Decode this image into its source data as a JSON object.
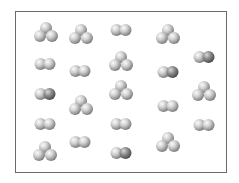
{
  "diagram": {
    "box": {
      "left": 15,
      "top": 11,
      "width": 212,
      "height": 162,
      "border_color": "#6a6a6a"
    },
    "atom": {
      "radius": 6,
      "light_color": "#c9c9c9",
      "dark_color": "#8a8a8a",
      "highlight": "#f4f4f4",
      "shadow": "#7a7a7a"
    },
    "molecules": [
      {
        "type": "triatomic",
        "x": 46,
        "y": 34
      },
      {
        "type": "triatomic",
        "x": 81,
        "y": 36
      },
      {
        "type": "diatomic",
        "x": 121,
        "y": 30,
        "dark_right": false
      },
      {
        "type": "triatomic",
        "x": 168,
        "y": 36
      },
      {
        "type": "diatomic",
        "x": 45,
        "y": 64,
        "dark_right": false
      },
      {
        "type": "diatomic",
        "x": 80,
        "y": 71,
        "dark_right": false
      },
      {
        "type": "triatomic",
        "x": 121,
        "y": 63
      },
      {
        "type": "diatomic",
        "x": 168,
        "y": 72,
        "dark_right": true
      },
      {
        "type": "diatomic",
        "x": 204,
        "y": 57,
        "dark_right": true
      },
      {
        "type": "diatomic",
        "x": 45,
        "y": 94,
        "dark_right": true
      },
      {
        "type": "triatomic",
        "x": 81,
        "y": 107
      },
      {
        "type": "triatomic",
        "x": 121,
        "y": 92
      },
      {
        "type": "diatomic",
        "x": 168,
        "y": 106,
        "dark_right": false
      },
      {
        "type": "triatomic",
        "x": 204,
        "y": 93
      },
      {
        "type": "diatomic",
        "x": 45,
        "y": 124,
        "dark_right": false
      },
      {
        "type": "diatomic",
        "x": 80,
        "y": 142,
        "dark_right": false
      },
      {
        "type": "diatomic",
        "x": 121,
        "y": 124,
        "dark_right": false
      },
      {
        "type": "diatomic",
        "x": 204,
        "y": 125,
        "dark_right": false
      },
      {
        "type": "triatomic",
        "x": 45,
        "y": 153
      },
      {
        "type": "diatomic",
        "x": 121,
        "y": 153,
        "dark_right": true
      },
      {
        "type": "triatomic",
        "x": 168,
        "y": 144
      }
    ],
    "counts": {
      "diatomic": 12,
      "triatomic": 9,
      "total": 21
    }
  }
}
